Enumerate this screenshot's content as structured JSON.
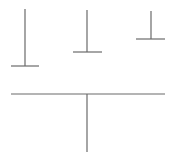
{
  "canvas": {
    "width": 173,
    "height": 163,
    "background": "#ffffff"
  },
  "stroke": {
    "color": "#6a6a6a",
    "width": 1.2
  },
  "shapes": [
    {
      "name": "inverted-t-left",
      "stem": {
        "x": 25,
        "y1": 9,
        "y2": 66
      },
      "base": {
        "y": 66,
        "x1": 11,
        "x2": 39
      }
    },
    {
      "name": "inverted-t-middle",
      "stem": {
        "x": 87,
        "y1": 10,
        "y2": 52
      },
      "base": {
        "y": 52,
        "x1": 73,
        "x2": 102
      }
    },
    {
      "name": "inverted-t-right",
      "stem": {
        "x": 151,
        "y1": 11,
        "y2": 39
      },
      "base": {
        "y": 39,
        "x1": 136,
        "x2": 165
      }
    },
    {
      "name": "t-bottom",
      "bar": {
        "y": 94,
        "x1": 11,
        "x2": 165
      },
      "stem": {
        "x": 87,
        "y1": 94,
        "y2": 152
      }
    }
  ]
}
